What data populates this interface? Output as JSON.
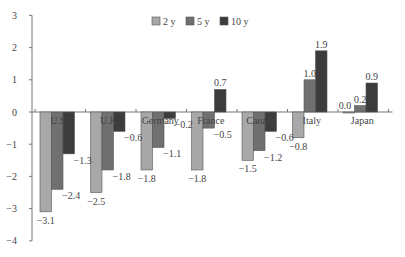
{
  "chart_data": {
    "type": "bar",
    "title": "",
    "xlabel": "",
    "ylabel": "",
    "ylim": [
      -4,
      3
    ],
    "yticks": [
      3,
      2,
      1,
      0,
      -1,
      -2,
      -3,
      -4
    ],
    "grid": false,
    "legend_position": "top-center",
    "categories": [
      "U.S.",
      "U.K.",
      "Germany",
      "France",
      "Canada",
      "Italy",
      "Japan"
    ],
    "series": [
      {
        "name": "2 y",
        "color": "#a8a8a8",
        "values": [
          -3.1,
          -2.5,
          -1.8,
          -1.8,
          -1.5,
          -0.8,
          0.0
        ]
      },
      {
        "name": "5 y",
        "color": "#707070",
        "values": [
          -2.4,
          -1.8,
          -1.1,
          -0.5,
          -1.2,
          1.0,
          0.2
        ]
      },
      {
        "name": "10 y",
        "color": "#3c3c3c",
        "values": [
          -1.3,
          -0.6,
          -0.2,
          0.7,
          -0.6,
          1.9,
          0.9
        ]
      }
    ],
    "data_labels": [
      [
        "-3.1",
        "-2.5",
        "-1.8",
        "-1.8",
        "-1.5",
        "-0.8",
        "0.0"
      ],
      [
        "-2.4",
        "-1.8",
        "-1.1",
        "",
        "-1.2",
        "1.0",
        "0.2"
      ],
      [
        "-1.3",
        "-0.6",
        "-0.2",
        "0.7",
        "-0.6",
        "1.9",
        "0.9"
      ]
    ],
    "extra_labels": {
      "France_5y": "-0.5"
    }
  }
}
